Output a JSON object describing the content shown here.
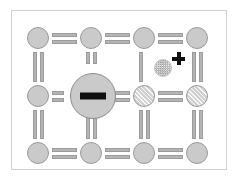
{
  "figure": {
    "title": "Crystal lattice with point defects",
    "background_color": "#ffffff",
    "frame_color": "#d2d2d2",
    "width": 239,
    "height": 181
  },
  "palette": {
    "atom_fill": "#cacaca",
    "atom_stroke": "#9a9a9a",
    "bond_fill": "#b4b4b4",
    "bond_stroke": "#9c9c9c",
    "charge_sign": "#101010",
    "interstitial_fill": "#e8e8e8"
  },
  "lattice": {
    "rows": 3,
    "columns": 4,
    "atoms": [
      {
        "id": "atom-r1c1",
        "row": 1,
        "col": 1,
        "x": 27,
        "y": 27,
        "d": 22,
        "style": "plain",
        "label": "lattice atom"
      },
      {
        "id": "atom-r1c2",
        "row": 1,
        "col": 2,
        "x": 80,
        "y": 27,
        "d": 22,
        "style": "plain",
        "label": "lattice atom"
      },
      {
        "id": "atom-r1c3",
        "row": 1,
        "col": 3,
        "x": 133,
        "y": 27,
        "d": 22,
        "style": "plain",
        "label": "lattice atom"
      },
      {
        "id": "atom-r1c4",
        "row": 1,
        "col": 4,
        "x": 186,
        "y": 27,
        "d": 22,
        "style": "plain",
        "label": "lattice atom"
      },
      {
        "id": "atom-r2c1",
        "row": 2,
        "col": 1,
        "x": 27,
        "y": 85,
        "d": 22,
        "style": "plain",
        "label": "lattice atom"
      },
      {
        "id": "atom-r2c3",
        "row": 2,
        "col": 3,
        "x": 133,
        "y": 85,
        "d": 22,
        "style": "hatched",
        "label": "lattice atom"
      },
      {
        "id": "atom-r2c4",
        "row": 2,
        "col": 4,
        "x": 186,
        "y": 85,
        "d": 22,
        "style": "hatched",
        "label": "lattice atom"
      },
      {
        "id": "atom-r3c1",
        "row": 3,
        "col": 1,
        "x": 27,
        "y": 142,
        "d": 22,
        "style": "plain",
        "label": "lattice atom"
      },
      {
        "id": "atom-r3c2",
        "row": 3,
        "col": 2,
        "x": 80,
        "y": 142,
        "d": 22,
        "style": "plain",
        "label": "lattice atom"
      },
      {
        "id": "atom-r3c3",
        "row": 3,
        "col": 3,
        "x": 133,
        "y": 142,
        "d": 22,
        "style": "plain",
        "label": "lattice atom"
      },
      {
        "id": "atom-r3c4",
        "row": 3,
        "col": 4,
        "x": 186,
        "y": 142,
        "d": 22,
        "style": "plain",
        "label": "lattice atom"
      }
    ],
    "bonds_horizontal": [
      {
        "id": "bond-h-r1c1",
        "x": 52,
        "y": 33,
        "len": 25,
        "kind": "double"
      },
      {
        "id": "bond-h-r1c2",
        "x": 105,
        "y": 33,
        "len": 25,
        "kind": "double"
      },
      {
        "id": "bond-h-r1c3",
        "x": 158,
        "y": 33,
        "len": 25,
        "kind": "double"
      },
      {
        "id": "bond-h-r2c1",
        "x": 52,
        "y": 91,
        "len": 12,
        "kind": "double"
      },
      {
        "id": "bond-h-r2c2",
        "x": 104,
        "y": 91,
        "len": 26,
        "kind": "double"
      },
      {
        "id": "bond-h-r2c3",
        "x": 158,
        "y": 91,
        "len": 25,
        "kind": "double"
      },
      {
        "id": "bond-h-r3c1",
        "x": 52,
        "y": 148,
        "len": 25,
        "kind": "double"
      },
      {
        "id": "bond-h-r3c2",
        "x": 105,
        "y": 148,
        "len": 25,
        "kind": "double"
      },
      {
        "id": "bond-h-r3c3",
        "x": 158,
        "y": 148,
        "len": 25,
        "kind": "double"
      }
    ],
    "bonds_vertical": [
      {
        "id": "bond-v-c1r1",
        "x": 33,
        "y": 52,
        "len": 30,
        "kind": "double"
      },
      {
        "id": "bond-v-c2r1",
        "x": 86,
        "y": 52,
        "len": 12,
        "kind": "double"
      },
      {
        "id": "bond-v-c3r1",
        "x": 139,
        "y": 52,
        "len": 30,
        "kind": "single"
      },
      {
        "id": "bond-v-c4r1",
        "x": 192,
        "y": 52,
        "len": 30,
        "kind": "double"
      },
      {
        "id": "bond-v-c1r2",
        "x": 33,
        "y": 110,
        "len": 29,
        "kind": "double"
      },
      {
        "id": "bond-v-c2r2",
        "x": 86,
        "y": 110,
        "len": 29,
        "kind": "double"
      },
      {
        "id": "bond-v-c3r2",
        "x": 139,
        "y": 110,
        "len": 29,
        "kind": "double"
      },
      {
        "id": "bond-v-c4r2",
        "x": 192,
        "y": 110,
        "len": 29,
        "kind": "double"
      }
    ]
  },
  "defects": {
    "negative_ion": {
      "id": "ion-negative",
      "x": 70,
      "y": 73,
      "d": 46,
      "charge_symbol": "−",
      "charge_sign": "negative",
      "label": "large negatively charged ion"
    },
    "interstitial": {
      "id": "interstitial-particle",
      "x": 154,
      "y": 59,
      "d": 18,
      "charge_symbol": "+",
      "charge_sign": "positive",
      "charge_x": 172,
      "charge_y": 52,
      "label": "interstitial positively charged particle"
    }
  }
}
